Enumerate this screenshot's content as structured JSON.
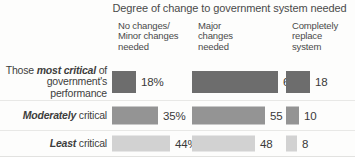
{
  "chart_data": {
    "type": "bar",
    "title": "Degree of change to government system needed",
    "orientation": "horizontal",
    "grid": false,
    "legend": "none",
    "xlabel": "",
    "ylabel": "",
    "xlim": [
      0,
      70
    ],
    "categories": [
      "Those most critical of government's performance",
      "Moderately critical",
      "Least critical"
    ],
    "series": [
      {
        "name": "No changes/Minor changes needed",
        "values": [
          18,
          35,
          44
        ]
      },
      {
        "name": "Major changes needed",
        "values": [
          65,
          55,
          48
        ]
      },
      {
        "name": "Completely replace system",
        "values": [
          18,
          10,
          8
        ]
      }
    ],
    "value_labels": [
      [
        "18%",
        "65",
        "18"
      ],
      [
        "35%",
        "55",
        "10"
      ],
      [
        "44%",
        "48",
        "8"
      ]
    ],
    "colors": [
      "#6d6d6d",
      "#949494",
      "#d2d2d2"
    ],
    "units": "percent"
  },
  "title": "Degree of change to government system needed",
  "columns": [
    {
      "id": "no-minor-changes",
      "label": "No changes/\nMinor changes\nneeded"
    },
    {
      "id": "major-changes",
      "label": "Major\nchanges\nneeded"
    },
    {
      "id": "completely-replace",
      "label": "Completely\nreplace\nsystem"
    }
  ],
  "rows": [
    {
      "id": "most-critical",
      "label_emphasis": "most critical",
      "label_prefix": "Those ",
      "label_suffix": " of government's performance",
      "color": "#6d6d6d",
      "cells": [
        {
          "value": 18,
          "label": "18%"
        },
        {
          "value": 65,
          "label": "65"
        },
        {
          "value": 18,
          "label": "18"
        }
      ]
    },
    {
      "id": "moderately-critical",
      "label_emphasis": "Moderately",
      "label_prefix": "",
      "label_suffix": " critical",
      "color": "#949494",
      "cells": [
        {
          "value": 35,
          "label": "35%"
        },
        {
          "value": 55,
          "label": "55"
        },
        {
          "value": 10,
          "label": "10"
        }
      ]
    },
    {
      "id": "least-critical",
      "label_emphasis": "Least",
      "label_prefix": "",
      "label_suffix": " critical",
      "color": "#d2d2d2",
      "cells": [
        {
          "value": 44,
          "label": "44%"
        },
        {
          "value": 48,
          "label": "48"
        },
        {
          "value": 8,
          "label": "8"
        }
      ]
    }
  ],
  "scale": {
    "px_per_unit": 1.32,
    "bar_height_row0": 22,
    "bar_height_row1": 18,
    "bar_height_row2": 16
  }
}
